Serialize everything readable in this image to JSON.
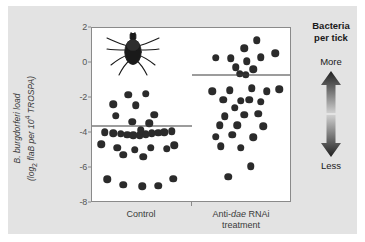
{
  "figure": {
    "background": "#ffffff",
    "panel_background": "#e3e3e3",
    "plot_background": "#ffffff",
    "dot_color": "#2b2b2b",
    "mean_line_color": "#3a3a3a",
    "axis_color": "#8a8a8a"
  },
  "y_axis": {
    "title_line1": "B. burgdorferi load",
    "title_line2_prefix": "(log",
    "title_line2_sub": "2",
    "title_line2_mid": " flaB per 10",
    "title_line2_sup": "4",
    "title_line2_suffix": " TROSPA)",
    "ticks": [
      "2",
      "0",
      "-2",
      "-4",
      "-6",
      "-8"
    ],
    "min": -8,
    "max": 2
  },
  "x_axis": {
    "control_label": "Control",
    "treatment_label_part1": "Anti-",
    "treatment_label_italic": "dae",
    "treatment_label_part2": " RNAi",
    "treatment_label_line2": "treatment"
  },
  "legend": {
    "title_line1": "Bacteria",
    "title_line2": "per tick",
    "more_label": "More",
    "less_label": "Less",
    "arrow_dark": "#1f1f1f",
    "arrow_light": "#c9c9c9"
  },
  "illustration": {
    "name": "tick-illustration",
    "color": "#1a1a1a"
  },
  "chart_data": {
    "type": "scatter",
    "title": "",
    "xlabel": "",
    "ylabel": "B. burgdorferi load (log2 flaB per 10^4 TROSPA)",
    "ylim": [
      -8,
      2
    ],
    "yticks": [
      2,
      0,
      -2,
      -4,
      -6,
      -8
    ],
    "grid": false,
    "legend_position": "right",
    "categories": [
      "Control",
      "Anti-dae RNAi treatment"
    ],
    "series": [
      {
        "name": "Control",
        "mean": -3.6,
        "n": 33,
        "points": [
          {
            "x": 0.06,
            "y": -1.75
          },
          {
            "x": -0.22,
            "y": -1.8
          },
          {
            "x": -0.46,
            "y": -2.35
          },
          {
            "x": -0.1,
            "y": -2.4
          },
          {
            "x": -0.42,
            "y": -3.0
          },
          {
            "x": 0.2,
            "y": -2.95
          },
          {
            "x": -0.16,
            "y": -3.35
          },
          {
            "x": 0.12,
            "y": -3.45
          },
          {
            "x": -0.6,
            "y": -3.95
          },
          {
            "x": -0.46,
            "y": -4.0
          },
          {
            "x": -0.34,
            "y": -4.05
          },
          {
            "x": -0.24,
            "y": -4.1
          },
          {
            "x": -0.14,
            "y": -4.12
          },
          {
            "x": -0.04,
            "y": -4.12
          },
          {
            "x": 0.06,
            "y": -4.08
          },
          {
            "x": 0.16,
            "y": -4.02
          },
          {
            "x": 0.26,
            "y": -3.98
          },
          {
            "x": 0.36,
            "y": -3.95
          },
          {
            "x": 0.48,
            "y": -3.9
          },
          {
            "x": -0.02,
            "y": -3.85
          },
          {
            "x": -0.66,
            "y": -4.65
          },
          {
            "x": -0.4,
            "y": -4.85
          },
          {
            "x": -0.12,
            "y": -4.95
          },
          {
            "x": 0.14,
            "y": -4.85
          },
          {
            "x": 0.4,
            "y": -4.9
          },
          {
            "x": 0.52,
            "y": -4.7
          },
          {
            "x": -0.3,
            "y": -5.25
          },
          {
            "x": 0.02,
            "y": -5.35
          },
          {
            "x": -0.56,
            "y": -6.65
          },
          {
            "x": -0.3,
            "y": -6.95
          },
          {
            "x": 0.0,
            "y": -7.05
          },
          {
            "x": 0.26,
            "y": -7.0
          },
          {
            "x": 0.5,
            "y": -6.6
          }
        ]
      },
      {
        "name": "Anti-dae RNAi treatment",
        "mean": -0.7,
        "n": 34,
        "points": [
          {
            "x": 0.24,
            "y": 1.3
          },
          {
            "x": 0.04,
            "y": 0.85
          },
          {
            "x": -0.42,
            "y": 0.3
          },
          {
            "x": -0.18,
            "y": 0.28
          },
          {
            "x": 0.08,
            "y": 0.1
          },
          {
            "x": 0.3,
            "y": 0.32
          },
          {
            "x": 0.54,
            "y": 0.55
          },
          {
            "x": -0.1,
            "y": -0.25
          },
          {
            "x": 0.18,
            "y": -0.35
          },
          {
            "x": -0.04,
            "y": -0.62
          },
          {
            "x": 0.06,
            "y": -0.68
          },
          {
            "x": -0.48,
            "y": -1.6
          },
          {
            "x": -0.2,
            "y": -1.55
          },
          {
            "x": 0.16,
            "y": -1.45
          },
          {
            "x": 0.4,
            "y": -1.6
          },
          {
            "x": 0.6,
            "y": -1.5
          },
          {
            "x": -0.3,
            "y": -2.1
          },
          {
            "x": -0.02,
            "y": -2.15
          },
          {
            "x": 0.12,
            "y": -2.1
          },
          {
            "x": 0.3,
            "y": -2.2
          },
          {
            "x": -0.12,
            "y": -2.55
          },
          {
            "x": -0.28,
            "y": -3.05
          },
          {
            "x": 0.04,
            "y": -2.95
          },
          {
            "x": 0.26,
            "y": -2.9
          },
          {
            "x": -0.36,
            "y": -3.55
          },
          {
            "x": -0.08,
            "y": -3.55
          },
          {
            "x": 0.34,
            "y": -3.6
          },
          {
            "x": -0.42,
            "y": -4.2
          },
          {
            "x": -0.16,
            "y": -4.1
          },
          {
            "x": 0.18,
            "y": -4.25
          },
          {
            "x": -0.34,
            "y": -4.75
          },
          {
            "x": -0.02,
            "y": -4.85
          },
          {
            "x": 0.14,
            "y": -5.9
          },
          {
            "x": -0.22,
            "y": -6.5
          }
        ]
      }
    ]
  }
}
